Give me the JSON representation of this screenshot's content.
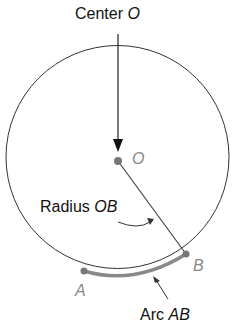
{
  "diagram": {
    "labels": {
      "center_prefix": "Center ",
      "center_var": "O",
      "point_o": "O",
      "radius_prefix": "Radius ",
      "radius_var": "OB",
      "point_a": "A",
      "point_b": "B",
      "arc_prefix": "Arc ",
      "arc_var": "AB"
    },
    "colors": {
      "line": "#333333",
      "arc": "#888888",
      "point": "#777777",
      "label_gray": "#8a8a8a"
    }
  }
}
